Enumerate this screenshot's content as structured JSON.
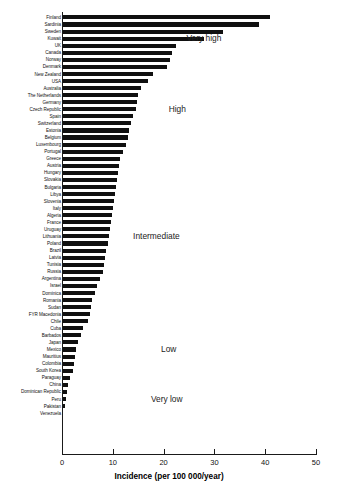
{
  "chart_data": {
    "type": "bar",
    "orientation": "horizontal",
    "title": "",
    "xlabel": "Incidence (per 100 000/year)",
    "ylabel": "",
    "xlim": [
      0,
      50
    ],
    "xticks": [
      0,
      10,
      20,
      30,
      40,
      50
    ],
    "grid": false,
    "legend": null,
    "bar_color": "#101010",
    "categories": [
      "Finland",
      "Sardinia",
      "Sweden",
      "Kuwait",
      "UK",
      "Canada",
      "Norway",
      "Denmark",
      "New Zealand",
      "USA",
      "Australia",
      "The Netherlands",
      "Germany",
      "Czech Republic",
      "Spain",
      "Switzerland",
      "Estonia",
      "Belgium",
      "Luxembourg",
      "Portugal",
      "Greece",
      "Austria",
      "Hungary",
      "Slovakia",
      "Bulgaria",
      "Libya",
      "Slovenia",
      "Italy",
      "Algeria",
      "France",
      "Uruguay",
      "Lithuania",
      "Poland",
      "Brazil",
      "Latvia",
      "Tunisia",
      "Russia",
      "Argentina",
      "Israel",
      "Dominica",
      "Romania",
      "Sudan",
      "FYR Macedonia",
      "Chile",
      "Cuba",
      "Barbados",
      "Japan",
      "Mexico",
      "Mauritius",
      "Colombia",
      "South Korea",
      "Paraguay",
      "China",
      "Dominican Republic",
      "Peru",
      "Pakistan",
      "Venezuela"
    ],
    "values": [
      41.0,
      38.8,
      31.7,
      28.0,
      22.5,
      21.7,
      21.2,
      20.6,
      18.0,
      17.0,
      15.5,
      15.0,
      14.8,
      14.5,
      14.0,
      13.6,
      13.2,
      13.0,
      12.6,
      12.0,
      11.5,
      11.3,
      11.0,
      10.8,
      10.6,
      10.4,
      10.2,
      10.0,
      9.8,
      9.6,
      9.4,
      9.2,
      9.0,
      8.6,
      8.4,
      8.2,
      8.0,
      7.4,
      6.8,
      6.4,
      6.0,
      5.8,
      5.5,
      5.2,
      4.2,
      3.8,
      3.2,
      2.8,
      2.6,
      2.4,
      2.2,
      1.6,
      1.2,
      1.0,
      0.8,
      0.5,
      0.1
    ],
    "annotations": [
      {
        "text": "Very high",
        "x": 24.5,
        "category_index": 3
      },
      {
        "text": "High",
        "x": 21.0,
        "category_index": 13
      },
      {
        "text": "Intermediate",
        "x": 14.0,
        "category_index": 31
      },
      {
        "text": "Low",
        "x": 19.5,
        "category_index": 47
      },
      {
        "text": "Very low",
        "x": 17.5,
        "category_index": 54
      }
    ]
  }
}
